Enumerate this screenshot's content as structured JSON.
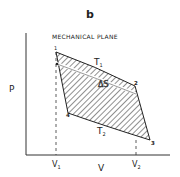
{
  "figure": {
    "panel_label": "b",
    "title": "MECHANICAL PLANE",
    "axes": {
      "y_label": "P",
      "x_label": "V",
      "x_ticks": [
        "V1",
        "V2"
      ]
    },
    "points": [
      "1",
      "2",
      "3",
      "4"
    ],
    "curve_labels": {
      "upper_isotherm": "T1",
      "lower_isotherm": "T2",
      "entropy_band": "ΔS"
    },
    "colors": {
      "ink": "#222222",
      "background": "#ffffff"
    }
  }
}
